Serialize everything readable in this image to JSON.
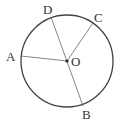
{
  "diagram": {
    "type": "circle-geometry",
    "circle": {
      "center_label": "O",
      "cx": 67,
      "cy": 61,
      "r": 46,
      "stroke": "#444444"
    },
    "points": {
      "A": {
        "label": "A",
        "x": 21,
        "y": 56,
        "lx": 6,
        "ly": 61
      },
      "B": {
        "label": "B",
        "x": 83,
        "y": 106,
        "lx": 82,
        "ly": 119
      },
      "C": {
        "label": "C",
        "x": 93,
        "y": 23,
        "lx": 94,
        "ly": 22
      },
      "D": {
        "label": "D",
        "x": 51,
        "y": 17,
        "lx": 43,
        "ly": 14
      },
      "O": {
        "label": "O",
        "x": 67,
        "y": 61,
        "lx": 71,
        "ly": 66
      }
    },
    "segments": [
      {
        "from": "D",
        "to": "B",
        "note": "diameter through O"
      },
      {
        "from": "O",
        "to": "A"
      },
      {
        "from": "O",
        "to": "C"
      }
    ]
  }
}
